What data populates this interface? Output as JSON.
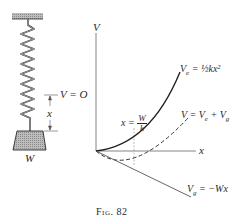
{
  "figure": {
    "caption": "Fig. 82",
    "spring_diagram": {
      "reference_label": "V = O",
      "displacement_label": "x",
      "weight_label": "W"
    },
    "graph": {
      "y_axis_label": "V",
      "x_axis_label": "x",
      "curves": [
        {
          "name": "elastic",
          "label_main": "V",
          "label_sub": "e",
          "label_rest": " = ½kx²",
          "style": "solid"
        },
        {
          "name": "total",
          "label_main": "V = V",
          "label_sub": "e",
          "label_rest": " + V",
          "label_sub2": "g",
          "style": "dashed"
        },
        {
          "name": "gravity",
          "label_main": "V",
          "label_sub": "g",
          "label_rest": " = −Wx",
          "style": "solid"
        }
      ],
      "equilibrium": {
        "lhs": "x = ",
        "num": "W",
        "den": "k"
      }
    }
  },
  "colors": {
    "ink": "#2a2a2a",
    "hatch": "#9a9a9a",
    "weight_fill": "#c8c8c8"
  }
}
